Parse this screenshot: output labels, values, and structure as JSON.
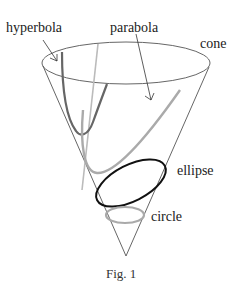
{
  "figure": {
    "caption": "Fig. 1",
    "labels": {
      "hyperbola": "hyperbola",
      "parabola": "parabola",
      "cone": "cone",
      "ellipse": "ellipse",
      "circle": "circle"
    },
    "colors": {
      "cone": "#555555",
      "hyperbola": "#666666",
      "parabola": "#aaaaaa",
      "ellipse": "#111111",
      "circle": "#aaaaaa",
      "guideline": "#bbbbbb"
    }
  }
}
